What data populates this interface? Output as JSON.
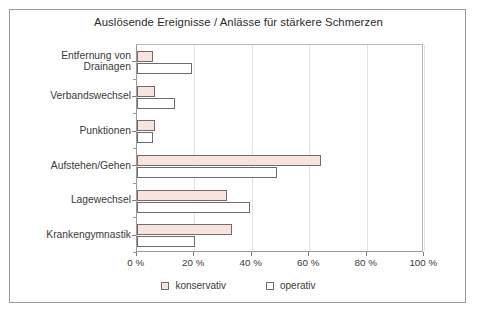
{
  "chart_data": {
    "type": "bar",
    "orientation": "horizontal",
    "title": "Auslösende Ereignisse / Anlässe für stärkere Schmerzen",
    "xlabel": "",
    "ylabel": "",
    "xlim": [
      0,
      100
    ],
    "xticks": [
      0,
      20,
      40,
      60,
      80,
      100
    ],
    "xtick_labels": [
      "0 %",
      "20 %",
      "40 %",
      "60 %",
      "80 %",
      "100 %"
    ],
    "grid": true,
    "grid_axis": "x",
    "legend_position": "bottom",
    "unit": "%",
    "categories": [
      "Entfernung von\nDrainagen",
      "Verbandswechsel",
      "Punktionen",
      "Aufstehen/Gehen",
      "Lagewechsel",
      "Krankengymnastik"
    ],
    "series": [
      {
        "name": "konservativ",
        "color": "#f8e4de",
        "edge_color": "#7a6a66",
        "values": [
          5.6,
          6.4,
          6.4,
          64.0,
          31.3,
          33.3
        ]
      },
      {
        "name": "operativ",
        "color": "#ffffff",
        "edge_color": "#6d6b6b",
        "values": [
          19.1,
          13.4,
          5.7,
          48.8,
          39.3,
          20.2
        ]
      }
    ]
  },
  "legend": {
    "items": [
      {
        "label": "konservativ",
        "swatch": "konservativ"
      },
      {
        "label": "operativ",
        "swatch": "operativ"
      }
    ]
  },
  "colors": {
    "frame": "#9a9a9a",
    "axis": "#7d7d7d",
    "grid": "#e2e0e0",
    "text": "#2b2b2b",
    "background": "#ffffff"
  }
}
